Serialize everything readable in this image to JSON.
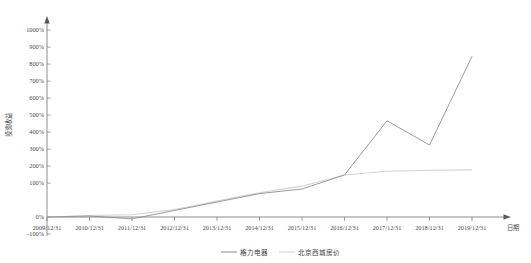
{
  "chart_data": {
    "type": "line",
    "title": "",
    "subtitle": "",
    "xlabel": "日期",
    "ylabel": "投资收益",
    "grid": false,
    "legend_position": "bottom",
    "x": [
      "2009/12/31",
      "2010/12/31",
      "2011/12/31",
      "2012/12/31",
      "2013/12/31",
      "2014/12/31",
      "2015/12/31",
      "2016/12/31",
      "2017/12/31",
      "2018/12/31",
      "2019/12/31"
    ],
    "xtick_labels": [
      "2009/12/31",
      "2010/12/31",
      "2011/12/31",
      "2012/12/31",
      "2013/12/31",
      "2014/12/31",
      "2015/12/31",
      "2016/12/31",
      "2017/12/31",
      "2018/12/31",
      "2019/12/31"
    ],
    "ytick_labels": [
      "1000%",
      "900%",
      "800%",
      "700%",
      "600%",
      "500%",
      "400%",
      "300%",
      "200%",
      "100%",
      "0%",
      "-100%"
    ],
    "ytick_values": [
      1000,
      900,
      800,
      700,
      600,
      500,
      400,
      300,
      200,
      100,
      0,
      -100
    ],
    "ylim": [
      -100,
      1000
    ],
    "yunit": "%",
    "series": [
      {
        "name": "格力电器",
        "color": "#8a8a8a",
        "values": [
          0,
          5,
          -10,
          35,
          80,
          125,
          150,
          225,
          515,
          385,
          860
        ]
      },
      {
        "name": "北京西城房价",
        "color": "#d2d2d2",
        "values": [
          0,
          8,
          12,
          40,
          85,
          130,
          165,
          225,
          245,
          250,
          252
        ]
      }
    ],
    "annotations": []
  },
  "legend": {
    "items": [
      {
        "label": "格力电器",
        "color": "#8a8a8a"
      },
      {
        "label": "北京西城房价",
        "color": "#d2d2d2"
      }
    ]
  }
}
